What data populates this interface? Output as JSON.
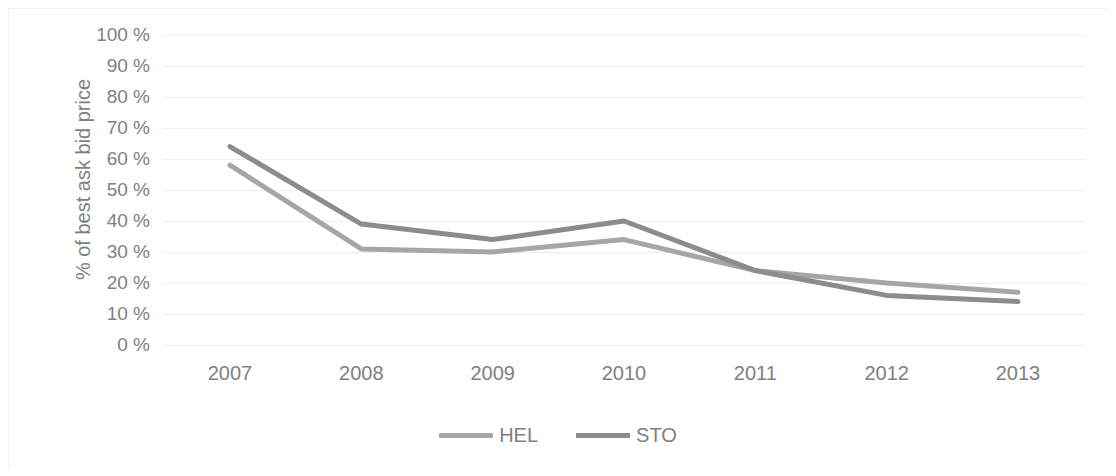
{
  "chart_data": {
    "type": "line",
    "title": "",
    "subtitle": "",
    "xlabel": "",
    "ylabel": "% of best ask bid price",
    "categories": [
      "2007",
      "2008",
      "2009",
      "2010",
      "2011",
      "2012",
      "2013"
    ],
    "x_tick_labels": [
      "2007",
      "2008",
      "2009",
      "2010",
      "2011",
      "2012",
      "2013"
    ],
    "y_tick_labels": [
      "100 %",
      "90 %",
      "80 %",
      "70 %",
      "60 %",
      "50 %",
      "40 %",
      "30 %",
      "20 %",
      "10 %",
      "0 %"
    ],
    "y_tick_values": [
      100,
      90,
      80,
      70,
      60,
      50,
      40,
      30,
      20,
      10,
      0
    ],
    "ylim": [
      0,
      100
    ],
    "y_tick_step": 10,
    "grid": "horizontal",
    "legend_position": "bottom",
    "series": [
      {
        "name": "HEL",
        "color": "#a6a6a6",
        "values": [
          58,
          31,
          30,
          34,
          24,
          20,
          17
        ]
      },
      {
        "name": "STO",
        "color": "#8c8c8c",
        "values": [
          64,
          39,
          34,
          40,
          24,
          16,
          14
        ]
      }
    ]
  },
  "legend": {
    "items": [
      {
        "label": "HEL"
      },
      {
        "label": "STO"
      }
    ]
  },
  "colors": {
    "hel": "#a6a6a6",
    "sto": "#8c8c8c",
    "gridline": "#eeeeee",
    "text": "#808080",
    "background": "#ffffff"
  }
}
